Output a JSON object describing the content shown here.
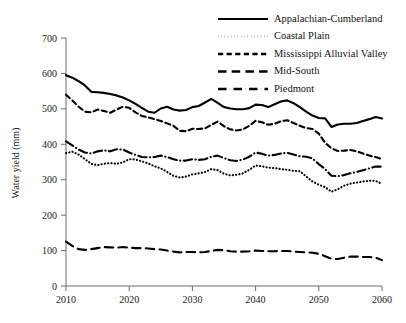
{
  "chart_data": {
    "type": "line",
    "title": "",
    "subtitle": "",
    "xlabel": "",
    "ylabel": "Water yield (mm)",
    "xlim": [
      2010,
      2060
    ],
    "ylim": [
      0,
      700
    ],
    "xticks": [
      2010,
      2020,
      2030,
      2040,
      2050,
      2060
    ],
    "xtick_labels": [
      "2010",
      "2020",
      "2030",
      "2040",
      "2050",
      "2060"
    ],
    "yticks": [
      0,
      100,
      200,
      300,
      400,
      500,
      600,
      700
    ],
    "ytick_labels": [
      "0",
      "100",
      "200",
      "300",
      "400",
      "500",
      "600",
      "700"
    ],
    "grid": false,
    "legend_position": "top-right",
    "x": [
      2010,
      2011,
      2012,
      2013,
      2014,
      2015,
      2016,
      2017,
      2018,
      2019,
      2020,
      2021,
      2022,
      2023,
      2024,
      2025,
      2026,
      2027,
      2028,
      2029,
      2030,
      2031,
      2032,
      2033,
      2034,
      2035,
      2036,
      2037,
      2038,
      2039,
      2040,
      2041,
      2042,
      2043,
      2044,
      2045,
      2046,
      2047,
      2048,
      2049,
      2050,
      2051,
      2052,
      2053,
      2054,
      2055,
      2056,
      2057,
      2058,
      2059,
      2060
    ],
    "series": [
      {
        "name": "Appalachian-Cumberland",
        "style": "solid",
        "color": "#000000",
        "values": [
          595,
          588,
          578,
          566,
          548,
          547,
          545,
          542,
          538,
          532,
          524,
          514,
          503,
          492,
          489,
          501,
          506,
          498,
          495,
          497,
          505,
          508,
          518,
          528,
          517,
          505,
          501,
          499,
          499,
          502,
          512,
          511,
          505,
          513,
          521,
          524,
          516,
          505,
          492,
          481,
          474,
          473,
          449,
          456,
          458,
          458,
          460,
          466,
          471,
          477,
          473
        ]
      },
      {
        "name": "Coastal Plain",
        "style": "dotted",
        "color": "#000000",
        "values": [
          375,
          379,
          371,
          358,
          345,
          341,
          345,
          347,
          345,
          349,
          358,
          357,
          352,
          346,
          338,
          332,
          322,
          311,
          306,
          309,
          315,
          318,
          322,
          330,
          327,
          317,
          312,
          314,
          318,
          328,
          340,
          338,
          334,
          333,
          330,
          328,
          325,
          324,
          309,
          295,
          286,
          279,
          266,
          273,
          283,
          289,
          292,
          295,
          297,
          297,
          288
        ]
      },
      {
        "name": "Mississippi Alluvial Valley",
        "style": "dashed",
        "color": "#000000",
        "values": [
          540,
          524,
          506,
          492,
          490,
          498,
          494,
          489,
          498,
          506,
          503,
          490,
          480,
          476,
          471,
          466,
          459,
          452,
          438,
          437,
          444,
          443,
          445,
          455,
          464,
          451,
          442,
          439,
          442,
          452,
          466,
          462,
          455,
          458,
          465,
          468,
          460,
          452,
          446,
          443,
          430,
          404,
          389,
          381,
          382,
          384,
          380,
          374,
          368,
          364,
          358
        ]
      },
      {
        "name": "Mid-South",
        "style": "long-dashed",
        "color": "#000000",
        "values": [
          125,
          113,
          104,
          102,
          104,
          107,
          110,
          109,
          108,
          110,
          108,
          107,
          107,
          106,
          104,
          103,
          100,
          97,
          95,
          96,
          96,
          95,
          96,
          99,
          102,
          101,
          98,
          97,
          97,
          98,
          100,
          99,
          98,
          98,
          99,
          99,
          97,
          96,
          95,
          94,
          91,
          84,
          77,
          76,
          80,
          83,
          83,
          82,
          82,
          80,
          73
        ]
      },
      {
        "name": "Piedmont",
        "style": "dash-dot",
        "color": "#000000",
        "values": [
          408,
          397,
          385,
          377,
          374,
          380,
          383,
          380,
          386,
          385,
          377,
          370,
          364,
          363,
          364,
          368,
          364,
          358,
          354,
          354,
          358,
          356,
          358,
          365,
          368,
          361,
          355,
          353,
          357,
          365,
          377,
          373,
          368,
          370,
          374,
          376,
          371,
          366,
          365,
          360,
          344,
          330,
          311,
          310,
          313,
          318,
          322,
          327,
          332,
          337,
          337
        ]
      }
    ]
  },
  "legend": {
    "items": [
      {
        "label": "Appalachian-Cumberland",
        "style": "solid"
      },
      {
        "label": "Coastal Plain",
        "style": "dotted"
      },
      {
        "label": "Mississippi Alluvial Valley",
        "style": "dashed"
      },
      {
        "label": "Mid-South",
        "style": "long-dashed"
      },
      {
        "label": "Piedmont",
        "style": "dash-dot"
      }
    ]
  }
}
